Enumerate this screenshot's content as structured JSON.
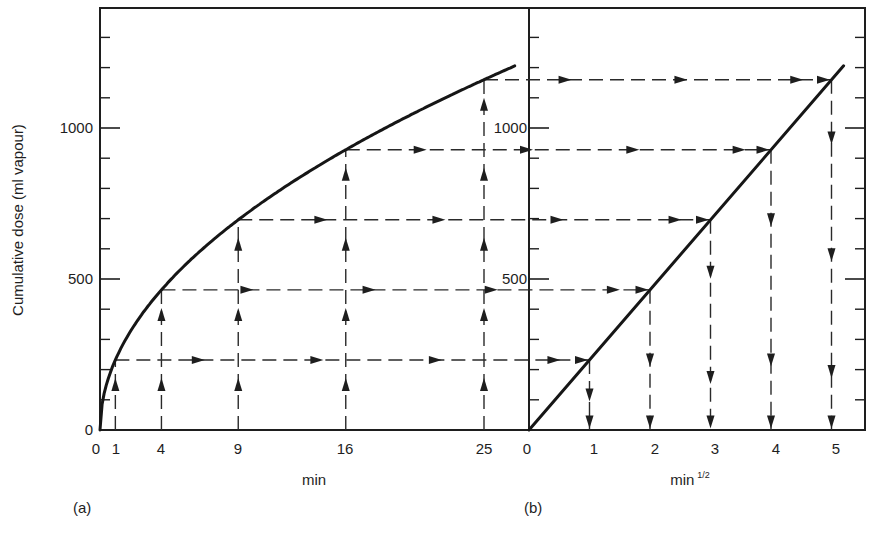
{
  "figure": {
    "panel_a_label": "(a)",
    "panel_b_label": "(b)",
    "ylabel": "Cumulative dose (ml vapour)",
    "panel_a_xlabel": "min",
    "panel_b_xlabel_base": "min",
    "panel_b_xlabel_sup": "1/2",
    "y_tick_labels": [
      "0",
      "500",
      "1000"
    ],
    "panel_a_x_tick_labels": [
      "0",
      "1",
      "4",
      "9",
      "16",
      "25"
    ],
    "panel_b_x_tick_labels": [
      "0",
      "1",
      "2",
      "3",
      "4",
      "5"
    ],
    "panel_b_y_tick_labels": [
      "500",
      "1000"
    ],
    "colors": {
      "ink": "#1e1e1e",
      "background": "#ffffff"
    }
  },
  "chart_data": [
    {
      "panel": "a",
      "type": "line",
      "title": "",
      "xlabel": "min",
      "ylabel": "Cumulative dose (ml vapour)",
      "x_ticks": [
        0,
        1,
        4,
        9,
        16,
        25
      ],
      "y_ticks": [
        0,
        500,
        1000
      ],
      "y_minor_tick_step": 100,
      "xlim": [
        0,
        28
      ],
      "ylim": [
        0,
        1400
      ],
      "grid": false,
      "series": [
        {
          "name": "Cumulative dose vs time",
          "x": [
            0,
            1,
            4,
            9,
            16,
            25,
            27
          ],
          "y": [
            0,
            232,
            464,
            696,
            928,
            1160,
            1205
          ]
        }
      ],
      "annotations": "Dashed guide lines with arrows rise vertically from t = 1, 4, 9, 16, 25 min to the curve, then run horizontally rightward across to panel (b)"
    },
    {
      "panel": "b",
      "type": "line",
      "title": "",
      "xlabel": "min^1/2",
      "ylabel": "Cumulative dose (ml vapour)",
      "x_ticks": [
        0,
        1,
        2,
        3,
        4,
        5
      ],
      "y_ticks": [
        500,
        1000
      ],
      "y_minor_tick_step": 100,
      "xlim": [
        0,
        5.5
      ],
      "ylim": [
        0,
        1400
      ],
      "grid": false,
      "series": [
        {
          "name": "Cumulative dose vs square root of time",
          "x": [
            0,
            1,
            2,
            3,
            4,
            5,
            5.2
          ],
          "y": [
            0,
            232,
            464,
            696,
            928,
            1160,
            1206
          ]
        }
      ],
      "annotations": "Horizontal dashed arrows from panel (a) meet the straight line at sqrt(t) = 1..5, then dashed arrows drop vertically to the x-axis"
    }
  ]
}
